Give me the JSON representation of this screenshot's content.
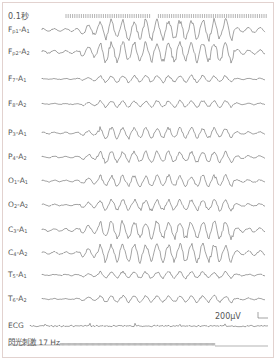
{
  "header": {
    "timescale_label": "0.1秒"
  },
  "channels": [
    {
      "name": "Fp1-A1",
      "main": "F",
      "sub1": "p1",
      "ref": "A",
      "sub2": "1",
      "y": 30,
      "amp": 9
    },
    {
      "name": "Fp2-A2",
      "main": "F",
      "sub1": "p2",
      "ref": "A",
      "sub2": "2",
      "y": 52,
      "amp": 9
    },
    {
      "name": "F7-A1",
      "main": "F",
      "sub1": "7",
      "ref": "A",
      "sub2": "1",
      "y": 79,
      "amp": 3
    },
    {
      "name": "F8-A2",
      "main": "F",
      "sub1": "8",
      "ref": "A",
      "sub2": "2",
      "y": 104,
      "amp": 3
    },
    {
      "name": "P3-A1",
      "main": "P",
      "sub1": "3",
      "ref": "A",
      "sub2": "1",
      "y": 133,
      "amp": 5
    },
    {
      "name": "P4-A2",
      "main": "P",
      "sub1": "4",
      "ref": "A",
      "sub2": "2",
      "y": 157,
      "amp": 5
    },
    {
      "name": "O1-A1",
      "main": "O",
      "sub1": "1",
      "ref": "A",
      "sub2": "1",
      "y": 181,
      "amp": 5
    },
    {
      "name": "O2-A2",
      "main": "O",
      "sub1": "2",
      "ref": "A",
      "sub2": "2",
      "y": 205,
      "amp": 5
    },
    {
      "name": "C3-A1",
      "main": "C",
      "sub1": "3",
      "ref": "A",
      "sub2": "1",
      "y": 230,
      "amp": 8
    },
    {
      "name": "C4-A2",
      "main": "C",
      "sub1": "4",
      "ref": "A",
      "sub2": "2",
      "y": 253,
      "amp": 8
    },
    {
      "name": "T5-A1",
      "main": "T",
      "sub1": "5",
      "ref": "A",
      "sub2": "1",
      "y": 275,
      "amp": 3
    },
    {
      "name": "T6-A2",
      "main": "T",
      "sub1": "6",
      "ref": "A",
      "sub2": "2",
      "y": 299,
      "amp": 3
    }
  ],
  "ecg": {
    "label": "ECG",
    "y": 326
  },
  "calibration": {
    "label": "200μV"
  },
  "stimulus": {
    "label": "閃光刺激 17 Hz"
  }
}
